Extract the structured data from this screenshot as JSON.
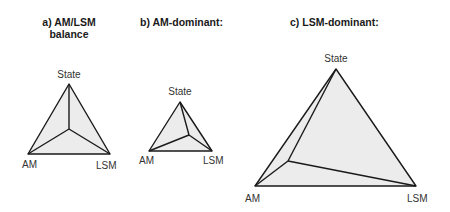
{
  "panels": [
    {
      "title": "a) AM/LSM\nbalance",
      "labels": {
        "state": "State",
        "am": "AM",
        "lsm": "LSM"
      },
      "vertices": {
        "state": [
          69,
          84
        ],
        "am": [
          28,
          154
        ],
        "lsm": [
          110,
          154
        ],
        "inner": [
          69,
          129
        ]
      }
    },
    {
      "title": "b) AM-dominant:",
      "labels": {
        "state": "State",
        "am": "AM",
        "lsm": "LSM"
      },
      "vertices": {
        "state": [
          180,
          102
        ],
        "am": [
          149,
          151
        ],
        "lsm": [
          212,
          151
        ],
        "inner": [
          189,
          135
        ]
      }
    },
    {
      "title": "c) LSM-dominant:",
      "labels": {
        "state": "State",
        "am": "AM",
        "lsm": "LSM"
      },
      "vertices": {
        "state": [
          336,
          69
        ],
        "am": [
          255,
          186
        ],
        "lsm": [
          416,
          186
        ],
        "inner": [
          288,
          161
        ]
      }
    }
  ],
  "colors": {
    "fill": "#ececec",
    "stroke": "#1a1a1a",
    "text": "#333333"
  }
}
